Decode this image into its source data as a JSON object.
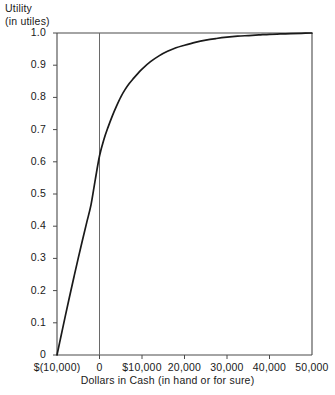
{
  "chart_data": {
    "type": "line",
    "title": "",
    "ylabel_lines": [
      "Utility",
      "(in utiles)"
    ],
    "ylabel": "Utility (in utiles)",
    "xlabel": "Dollars in Cash (in hand or for sure)",
    "xlim": [
      -10000,
      50000
    ],
    "ylim": [
      0,
      1.0
    ],
    "grid": false,
    "legend": null,
    "x_ticks": [
      -10000,
      0,
      10000,
      20000,
      30000,
      40000,
      50000
    ],
    "x_tick_labels": [
      "$(10,000)",
      "0",
      "$10,000",
      "20,000",
      "30,000",
      "40,000",
      "50,000"
    ],
    "y_ticks": [
      0,
      0.1,
      0.2,
      0.3,
      0.4,
      0.5,
      0.6,
      0.7,
      0.8,
      0.9,
      1.0
    ],
    "y_tick_labels": [
      "0",
      "0.1",
      "0.2",
      "0.3",
      "0.4",
      "0.5",
      "0.6",
      "0.7",
      "0.8",
      "0.9",
      "1.0"
    ],
    "reference_line_x": 0,
    "series": [
      {
        "name": "Utility curve",
        "color": "#1a1a1a",
        "x": [
          -10000,
          -9000,
          -8000,
          -7000,
          -6000,
          -5000,
          -4000,
          -3000,
          -2000,
          -1000,
          0,
          1000,
          2000,
          3000,
          4000,
          5000,
          6000,
          7000,
          8000,
          9000,
          10000,
          12000,
          14000,
          16000,
          18000,
          20000,
          22500,
          25000,
          27500,
          30000,
          32500,
          35000,
          37500,
          40000,
          42500,
          45000,
          47500,
          50000
        ],
        "y": [
          0.0,
          0.062,
          0.124,
          0.184,
          0.243,
          0.301,
          0.357,
          0.412,
          0.466,
          0.544,
          0.618,
          0.668,
          0.707,
          0.742,
          0.773,
          0.801,
          0.824,
          0.843,
          0.859,
          0.874,
          0.888,
          0.911,
          0.929,
          0.943,
          0.954,
          0.962,
          0.971,
          0.978,
          0.983,
          0.987,
          0.99,
          0.992,
          0.994,
          0.996,
          0.997,
          0.998,
          0.999,
          1.0
        ]
      }
    ]
  },
  "colors": {
    "curve": "#1a1a1a",
    "axis": "#4a4a4a",
    "background": "#ffffff"
  }
}
